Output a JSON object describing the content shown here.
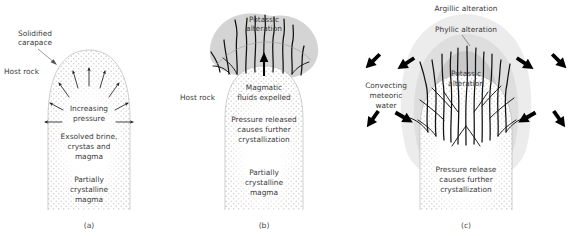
{
  "figure": {
    "type": "diagram",
    "panel_count": 3
  },
  "panels": [
    {
      "id": "a",
      "caption": "(a)",
      "labels": {
        "host_rock": "Host rock",
        "solidified_carapace": "Solidified\ncarapace",
        "solidified_carapace_line1": "Solidified",
        "solidified_carapace_line2": "carapace",
        "increasing_pressure_line1": "Increasing",
        "increasing_pressure_line2": "pressure",
        "exsolved_line1": "Exsolved brine,",
        "exsolved_line2": "crystas and",
        "exsolved_line3": "magma",
        "partially_line1": "Partially",
        "partially_line2": "crystalline",
        "partially_line3": "magma"
      },
      "features": {
        "stipple_fill": "partially crystalline magma dome",
        "arrow_count": 8,
        "arrow_direction": "radiating outward from centre"
      }
    },
    {
      "id": "b",
      "caption": "(b)",
      "labels": {
        "host_rock": "Host rock",
        "potassic_line1": "Potassic",
        "potassic_line2": "alteration",
        "magmatic_line1": "Magmatic",
        "magmatic_line2": "fluids expelled",
        "pressure_line1": "Pressure released",
        "pressure_line2": "causes further",
        "pressure_line3": "crystallization",
        "partially_line1": "Partially",
        "partially_line2": "crystalline",
        "partially_line3": "magma"
      },
      "features": {
        "halo_color": "#d0d0d0",
        "vein_count": 11,
        "vein_color": "#111111",
        "central_arrow_direction": "up"
      }
    },
    {
      "id": "c",
      "caption": "(c)",
      "labels": {
        "argillic_alteration": "Argillic alteration",
        "phyllic_alteration": "Phyllic alteration",
        "potassic_line1": "Potassic",
        "potassic_line2": "alteration",
        "convecting_line1": "Convecting",
        "convecting_line2": "meteoric",
        "convecting_line3": "water",
        "pressure_line1": "Pressure release",
        "pressure_line2": "causes further",
        "pressure_line3": "crystallization"
      },
      "features": {
        "zone_outer": "Argillic alteration",
        "zone_middle": "Phyllic alteration",
        "zone_inner": "Potassic alteration",
        "zone_outer_color": "#ececec",
        "zone_middle_color": "#dedede",
        "zone_inner_color": "#c9c9c9",
        "vein_count": 22,
        "thick_arrow_count": 8,
        "thick_arrow_direction": "inward toward the intrusion"
      }
    }
  ],
  "colors": {
    "background": "#ffffff",
    "text": "#3a3a3a",
    "vein": "#111111",
    "stipple": "#c8c8c8",
    "outline": "#b9b9b9",
    "arrow": "#000000"
  }
}
